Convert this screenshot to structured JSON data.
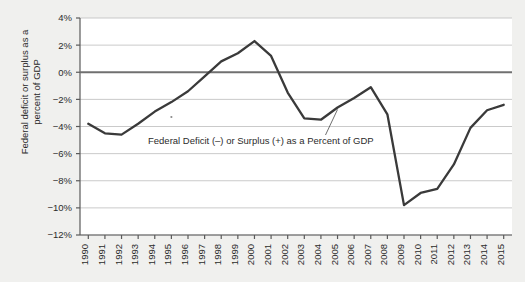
{
  "chart_data": {
    "type": "line",
    "title": "",
    "xlabel": "",
    "ylabel": "Federal deficit or surplus as a percent of GDP",
    "ylabel_line1": "Federal deficit or surplus as a",
    "ylabel_line2": "percent of GDP",
    "categories": [
      "1990",
      "1991",
      "1992",
      "1993",
      "1994",
      "1995",
      "1996",
      "1997",
      "1998",
      "1999",
      "2000",
      "2001",
      "2002",
      "2003",
      "2004",
      "2005",
      "2006",
      "2007",
      "2008",
      "2009",
      "2010",
      "2011",
      "2012",
      "2013",
      "2014",
      "2015"
    ],
    "series": [
      {
        "name": "Federal Deficit (–) or Surplus (+) as a Percent of GDP",
        "values": [
          -3.8,
          -4.5,
          -4.6,
          -3.8,
          -2.9,
          -2.2,
          -1.4,
          -0.3,
          0.8,
          1.4,
          2.3,
          1.2,
          -1.5,
          -3.4,
          -3.5,
          -2.6,
          -1.9,
          -1.1,
          -3.1,
          -9.8,
          -8.9,
          -8.6,
          -6.8,
          -4.1,
          -2.8,
          -2.4
        ]
      }
    ],
    "ylim": [
      -12,
      4
    ],
    "ytick_values": [
      4,
      2,
      0,
      -2,
      -4,
      -6,
      -8,
      -10,
      -12
    ],
    "ytick_labels": [
      "4%",
      "2%",
      "0%",
      "−2%",
      "−4%",
      "−6%",
      "−8%",
      "−10%",
      "−12%"
    ],
    "grid": "horizontal",
    "legend": "none",
    "annotations": [
      {
        "text": "Federal Deficit (–) or Surplus (+) as a Percent of GDP",
        "points_to_year": "2005",
        "points_to_value": -2.6
      }
    ],
    "zero_line": 0,
    "marker_point": {
      "year": "1995",
      "value": -3.3
    }
  },
  "colors": {
    "background": "#f0f0ee",
    "plot_background": "#ffffff",
    "line": "#3a3a3a",
    "zero_line": "#707070",
    "grid": "#bdbdbd",
    "axis": "#5a5a5a",
    "text": "#2b2b2b"
  }
}
